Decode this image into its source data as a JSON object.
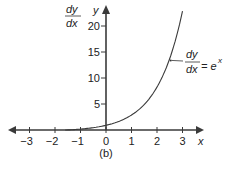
{
  "chart_data": {
    "type": "line",
    "title": "",
    "caption": "(b)",
    "xlabel": "x",
    "ylabel": "y",
    "ylabel_alt": {
      "numerator": "dy",
      "denominator": "dx"
    },
    "xlim": [
      -3.5,
      3.5
    ],
    "ylim": [
      0,
      23
    ],
    "grid": false,
    "x_ticks": [
      -3,
      -2,
      -1,
      0,
      1,
      2,
      3
    ],
    "x_tick_labels": [
      "−3",
      "−2",
      "−1",
      "0",
      "1",
      "2",
      "3"
    ],
    "y_ticks": [
      5,
      10,
      15,
      20
    ],
    "y_tick_labels": [
      "5",
      "10",
      "15",
      "20"
    ],
    "series": [
      {
        "name": "dy/dx = e^x",
        "function": "exp",
        "x_range": [
          -1.6,
          3.0
        ],
        "x": [
          -1.6,
          -1,
          -0.5,
          0,
          0.5,
          1,
          1.5,
          2,
          2.5,
          3
        ],
        "values": [
          0.2,
          0.37,
          0.61,
          1.0,
          1.65,
          2.72,
          4.48,
          7.39,
          12.18,
          20.09
        ]
      }
    ],
    "annotation": {
      "numerator": "dy",
      "denominator": "dx",
      "rhs": "= e",
      "superscript": "x",
      "points_to_x": 2.5
    }
  }
}
